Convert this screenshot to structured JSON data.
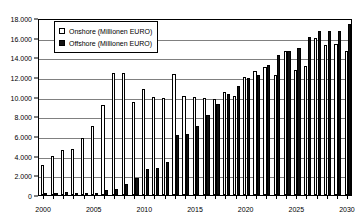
{
  "chart_data": {
    "type": "bar",
    "title": "",
    "subtitle": "",
    "xlabel": "",
    "ylabel": "",
    "ylim": [
      0,
      18000
    ],
    "ytick_values": [
      0,
      2000,
      4000,
      6000,
      8000,
      10000,
      12000,
      14000,
      16000,
      18000
    ],
    "ytick_labels": [
      "0",
      "2.000",
      "4.000",
      "6.000",
      "8.000",
      "10.000",
      "12.000",
      "14.000",
      "16.000",
      "18.000"
    ],
    "grid": true,
    "grid_axis": "y",
    "legend_position": "top-left",
    "categories": [
      "2000",
      "2001",
      "2002",
      "2003",
      "2004",
      "2005",
      "2006",
      "2007",
      "2008",
      "2009",
      "2010",
      "2011",
      "2012",
      "2013",
      "2014",
      "2015",
      "2016",
      "2017",
      "2018",
      "2019",
      "2020",
      "2021",
      "2022",
      "2023",
      "2024",
      "2025",
      "2026",
      "2027",
      "2028",
      "2029",
      "2030"
    ],
    "xtick_labels": [
      "2000",
      "2005",
      "2010",
      "2015",
      "2020",
      "2025",
      "2030"
    ],
    "xtick_categories": [
      "2000",
      "2005",
      "2010",
      "2015",
      "2020",
      "2025",
      "2030"
    ],
    "series": [
      {
        "name": "Onshore (Millionen EURO)",
        "color": "#ffffff",
        "edge_color": "#000000",
        "values": [
          3050,
          3950,
          4600,
          4700,
          5750,
          7000,
          9200,
          12400,
          12450,
          9500,
          10800,
          9950,
          9900,
          12300,
          10100,
          9950,
          9900,
          9750,
          10500,
          10050,
          12000,
          12600,
          13050,
          12200,
          14600,
          12700,
          13100,
          16000,
          15300,
          15350,
          14600
        ]
      },
      {
        "name": "Offshore (Millionen EURO)",
        "color": "#111111",
        "edge_color": "#000000",
        "values": [
          60,
          100,
          330,
          70,
          240,
          250,
          520,
          640,
          1100,
          1750,
          2620,
          2730,
          3400,
          6150,
          6200,
          7050,
          8150,
          9300,
          10300,
          11050,
          11900,
          12200,
          13200,
          14250,
          14600,
          15000,
          16050,
          16700,
          16700,
          16700,
          17350
        ]
      }
    ]
  },
  "legend": {
    "items": [
      {
        "label": "Onshore (Millionen EURO)",
        "swatch": "open-square"
      },
      {
        "label": "Offshore (Millionen EURO)",
        "swatch": "filled-square"
      }
    ]
  },
  "colors": {
    "onshore_fill": "#ffffff",
    "offshore_fill": "#111111",
    "grid": "#808080",
    "axis": "#000000",
    "background": "#ffffff"
  }
}
